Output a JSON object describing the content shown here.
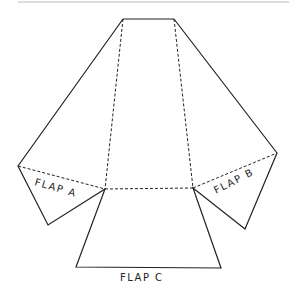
{
  "diagram": {
    "type": "folding-net",
    "labels": {
      "flap_a": "FLAP A",
      "flap_b": "FLAP B",
      "flap_c": "FLAP C"
    },
    "colors": {
      "line": "#222222",
      "rule": "#bbbbbb",
      "background": "#ffffff"
    }
  }
}
